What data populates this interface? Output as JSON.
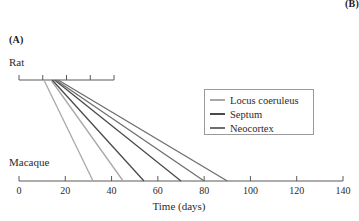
{
  "figure": {
    "panel_label": "(A)",
    "adjacent_panel_label": "(B)",
    "xlabel": "Time (days)",
    "top_axis_species": "Rat",
    "bottom_axis_species": "Macaque"
  },
  "legend": {
    "position": "center-right",
    "entries": [
      {
        "label": "Locus coeruleus",
        "color": "#a8a8a8"
      },
      {
        "label": "Septum",
        "color": "#4a4a4a"
      },
      {
        "label": "Neocortex",
        "color": "#6e6e6e"
      }
    ]
  },
  "axes": {
    "rat": {
      "label": "Rat",
      "min": 0,
      "max": 40,
      "ticks": [
        0,
        10,
        20,
        30,
        40
      ],
      "tick_labels": [
        "",
        "",
        "",
        "",
        ""
      ],
      "pixel_start": 19,
      "pixel_end": 114
    },
    "macaque": {
      "label": "Macaque",
      "min": 0,
      "max": 140,
      "ticks": [
        0,
        20,
        40,
        60,
        80,
        100,
        120,
        140
      ],
      "tick_labels": [
        "0",
        "20",
        "40",
        "60",
        "80",
        "100",
        "120",
        "140"
      ],
      "pixel_start": 19,
      "pixel_end": 343
    }
  },
  "chart_data": {
    "type": "line",
    "title": "",
    "subtitle": "",
    "xlabel": "Time (days)",
    "ylabel": "",
    "grid": false,
    "legend_position": "center-right",
    "xlim_rat": [
      0,
      40
    ],
    "xlim_macaque": [
      0,
      140
    ],
    "series": [
      {
        "name": "Locus coeruleus",
        "color": "#a8a8a8",
        "segments": [
          {
            "event": "onset",
            "rat_day": 10.5,
            "macaque_day": 32
          },
          {
            "event": "end",
            "rat_day": 13.5,
            "macaque_day": 45
          }
        ]
      },
      {
        "name": "Septum",
        "color": "#4a4a4a",
        "segments": [
          {
            "event": "onset",
            "rat_day": 14.0,
            "macaque_day": 54
          },
          {
            "event": "end",
            "rat_day": 15.0,
            "macaque_day": 70
          }
        ]
      },
      {
        "name": "Neocortex",
        "color": "#6e6e6e",
        "segments": [
          {
            "event": "onset",
            "rat_day": 15.5,
            "macaque_day": 80
          },
          {
            "event": "end",
            "rat_day": 16.5,
            "macaque_day": 90
          }
        ]
      }
    ]
  }
}
